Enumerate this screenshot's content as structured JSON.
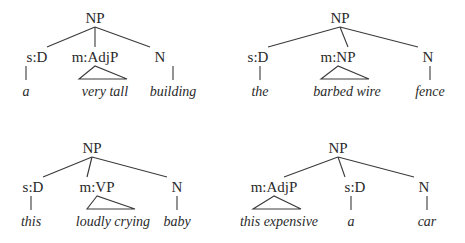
{
  "trees": [
    {
      "root": {
        "label": "NP",
        "x": 95,
        "y": 18
      },
      "children": [
        {
          "label": "s:D",
          "x": 37,
          "y": 57,
          "leaf": "a",
          "leaf_x": 26,
          "triangle": false
        },
        {
          "label": "m:AdjP",
          "x": 95,
          "y": 57,
          "leaf": "very tall",
          "leaf_x": 105,
          "triangle": true
        },
        {
          "label": "N",
          "x": 160,
          "y": 57,
          "leaf": "building",
          "leaf_x": 173,
          "triangle": false
        }
      ]
    },
    {
      "root": {
        "label": "NP",
        "x": 340,
        "y": 18
      },
      "children": [
        {
          "label": "s:D",
          "x": 258,
          "y": 57,
          "leaf": "the",
          "leaf_x": 260,
          "triangle": false
        },
        {
          "label": "m:NP",
          "x": 338,
          "y": 57,
          "leaf": "barbed wire",
          "leaf_x": 347,
          "triangle": true
        },
        {
          "label": "N",
          "x": 428,
          "y": 57,
          "leaf": "fence",
          "leaf_x": 430,
          "triangle": false
        }
      ]
    },
    {
      "root": {
        "label": "NP",
        "x": 92,
        "y": 148
      },
      "children": [
        {
          "label": "s:D",
          "x": 33,
          "y": 187,
          "leaf": "this",
          "leaf_x": 31,
          "triangle": false
        },
        {
          "label": "m:VP",
          "x": 97,
          "y": 187,
          "leaf": "loudly crying",
          "leaf_x": 113,
          "triangle": true
        },
        {
          "label": "N",
          "x": 177,
          "y": 187,
          "leaf": "baby",
          "leaf_x": 177,
          "triangle": false
        }
      ]
    },
    {
      "root": {
        "label": "NP",
        "x": 338,
        "y": 148
      },
      "children": [
        {
          "label": "m:AdjP",
          "x": 274,
          "y": 187,
          "leaf": "this expensive",
          "leaf_x": 279,
          "triangle": true
        },
        {
          "label": "s:D",
          "x": 355,
          "y": 187,
          "leaf": "a",
          "leaf_x": 351,
          "triangle": false
        },
        {
          "label": "N",
          "x": 424,
          "y": 187,
          "leaf": "car",
          "leaf_x": 427,
          "triangle": false
        }
      ]
    }
  ]
}
